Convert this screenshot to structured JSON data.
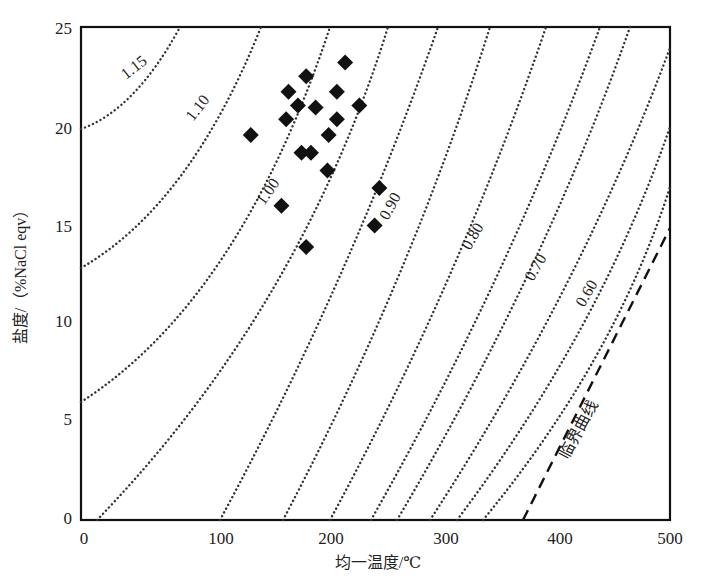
{
  "chart_data": {
    "type": "scatter",
    "title": "",
    "xlabel": "均一温度/℃",
    "ylabel": "盐度/（%NaCl eqv）",
    "xlim": [
      0,
      500
    ],
    "ylim": [
      0,
      25
    ],
    "grid": false,
    "x_ticks": [
      "0",
      "100",
      "200",
      "300",
      "400",
      "500"
    ],
    "y_ticks": [
      "0",
      "5",
      "10",
      "15",
      "20",
      "25"
    ],
    "series": [
      {
        "name": "fluid inclusions",
        "marker": "diamond",
        "points": [
          [
            143,
            19.6
          ],
          [
            175,
            21.8
          ],
          [
            190,
            22.6
          ],
          [
            223,
            23.3
          ],
          [
            216,
            21.8
          ],
          [
            183,
            21.1
          ],
          [
            198,
            21.0
          ],
          [
            235,
            21.1
          ],
          [
            173,
            20.4
          ],
          [
            216,
            20.4
          ],
          [
            209,
            19.6
          ],
          [
            186,
            18.7
          ],
          [
            194,
            18.7
          ],
          [
            208,
            17.8
          ],
          [
            252,
            16.9
          ],
          [
            169,
            16.0
          ],
          [
            248,
            15.0
          ],
          [
            190,
            13.9
          ]
        ]
      }
    ],
    "isolines": {
      "style": "dotted",
      "labels": [
        "1.15",
        "1.10",
        "1.00",
        "0.90",
        "0.80",
        "0.70",
        "0.60"
      ],
      "note": "density isolines (g/cm³)"
    },
    "annotations": [
      {
        "text": "1.15"
      },
      {
        "text": "1.10"
      },
      {
        "text": "1.00"
      },
      {
        "text": "0.90"
      },
      {
        "text": "0.80"
      },
      {
        "text": "0.70"
      },
      {
        "text": "0.60"
      },
      {
        "text": "临界曲线",
        "style": "dashed line"
      }
    ]
  },
  "labels": {
    "xlabel": "均一温度/℃",
    "ylabel": "盐度/（%NaCl eqv）",
    "x_ticks": [
      "0",
      "100",
      "200",
      "300",
      "400",
      "500"
    ],
    "y_ticks": [
      "0",
      "5",
      "10",
      "15",
      "20",
      "25"
    ],
    "curve_labels": [
      "1.15",
      "1.10",
      "1.00",
      "0.90",
      "0.80",
      "0.70",
      "0.60"
    ],
    "critical_curve": "临界曲线"
  }
}
